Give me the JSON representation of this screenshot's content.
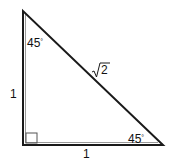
{
  "diagram": {
    "type": "right-triangle",
    "vertices": {
      "top": [
        23,
        11
      ],
      "right_angle": [
        23,
        145
      ],
      "bottom_right": [
        163,
        145
      ]
    },
    "labels": {
      "top_angle": "45",
      "bottom_right_angle": "45",
      "degree_symbol": "°",
      "left_leg": "1",
      "bottom_leg": "1",
      "hypotenuse_radical": "√",
      "hypotenuse_radicand": "2"
    },
    "right_angle_marker": true,
    "colors": {
      "stroke": "#1a1a1a",
      "marker_stroke": "#555555",
      "background": "#ffffff"
    }
  }
}
